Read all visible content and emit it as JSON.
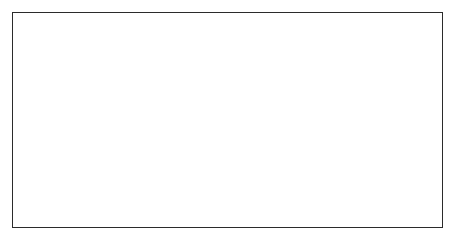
{
  "figure": {
    "background_color": "#ffffff",
    "frame_color": "#2b2b2b",
    "plot_border_color": "#1a1a1a",
    "gridline_color": "#c8c8c8",
    "line_color": "#1a1a1a"
  },
  "chart_data": {
    "type": "line",
    "title": "",
    "xlabel": "Year",
    "ylabel": "Year-over-year change (%)",
    "xlim": [
      1989.0,
      1998.0
    ],
    "ylim": [
      -2,
      12
    ],
    "grid": true,
    "legend": false,
    "x_tick_labels": [
      "'89",
      "'92",
      "'95",
      "'98"
    ],
    "x_tick_values": [
      1989,
      1992,
      1995,
      1998
    ],
    "y_tick_labels": [
      "12",
      "10",
      "8",
      "6",
      "4",
      "2",
      "0",
      "-2"
    ],
    "y_tick_values": [
      12,
      10,
      8,
      6,
      4,
      2,
      0,
      -2
    ],
    "series": [
      {
        "name": "Year-over-year change",
        "x": [
          1989.0,
          1989.12,
          1989.22,
          1989.3,
          1989.4,
          1989.52,
          1989.64,
          1989.78,
          1989.94,
          1990.1,
          1990.26,
          1990.42,
          1990.58,
          1990.74,
          1990.9,
          1991.04,
          1991.16,
          1991.28,
          1991.4,
          1991.54,
          1991.68,
          1991.82,
          1991.96,
          1992.1,
          1992.24,
          1992.38,
          1992.52,
          1992.66,
          1992.8,
          1992.94,
          1993.06,
          1993.16,
          1993.26,
          1993.36,
          1993.48,
          1993.62,
          1993.76,
          1993.9,
          1994.06,
          1994.22,
          1994.38,
          1994.54,
          1994.7,
          1994.86,
          1995.0,
          1995.1,
          1995.2,
          1995.32,
          1995.46,
          1995.6,
          1995.76,
          1995.92,
          1996.08,
          1996.24,
          1996.4,
          1996.56,
          1996.72,
          1996.86,
          1997.0,
          1997.16,
          1997.32,
          1997.5,
          1997.66,
          1997.8,
          1997.92,
          1998.0
        ],
        "y": [
          5.5,
          5.48,
          5.4,
          4.8,
          4.25,
          4.15,
          4.2,
          4.15,
          4.0,
          3.85,
          3.55,
          3.35,
          3.25,
          2.95,
          2.55,
          2.1,
          1.7,
          1.6,
          1.75,
          2.05,
          2.1,
          1.95,
          1.65,
          1.4,
          1.25,
          1.2,
          1.0,
          0.7,
          0.35,
          0.15,
          0.1,
          0.25,
          0.3,
          0.25,
          0.2,
          -0.45,
          -0.9,
          -0.6,
          -0.25,
          0.05,
          0.45,
          0.8,
          1.1,
          1.35,
          1.45,
          1.4,
          1.5,
          1.55,
          1.5,
          1.45,
          1.4,
          1.4,
          2.4,
          3.8,
          5.0,
          5.9,
          6.35,
          6.5,
          6.4,
          6.0,
          5.7,
          6.2,
          6.6,
          7.0,
          7.6,
          8.1
        ]
      },
      {
        "name": "Year-over-year change (continued)",
        "x": [
          1998.0,
          1998.1,
          1998.22,
          1998.36,
          1998.5,
          1998.62,
          1998.72,
          1998.82,
          1998.92,
          1999.0
        ],
        "y": [
          8.1,
          8.4,
          8.8,
          9.2,
          9.55,
          9.8,
          9.95,
          10.0,
          9.9,
          9.6
        ]
      }
    ]
  },
  "axis_titles": {
    "x": "Year",
    "y": "Year-over-year change (%)"
  }
}
